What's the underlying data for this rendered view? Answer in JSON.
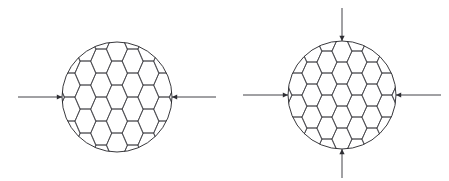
{
  "figure": {
    "background_color": "#ffffff",
    "line_color": "#3c3c41",
    "circle_color": "#232327",
    "arrow_color": "#2e2e33",
    "width": 449,
    "height": 181,
    "panels": [
      {
        "id": "left-panel",
        "name": "undeformed-specimen",
        "label": "",
        "circle": {
          "cx": 117,
          "cy": 97,
          "rx": 55,
          "ry": 55
        },
        "lattice": {
          "type": "hexagonal-honeycomb",
          "orientation": "flat-top",
          "cell_width": 21,
          "cell_height": 24,
          "col_spacing": 15.75,
          "row_spacing": 24
        },
        "loads": [
          {
            "name": "load-arrow-left",
            "direction": "right",
            "from_x": 18,
            "to_x": 62,
            "y": 97,
            "head": "inward"
          },
          {
            "name": "load-arrow-right",
            "direction": "left",
            "from_x": 216,
            "to_x": 172,
            "y": 97,
            "head": "inward"
          }
        ]
      },
      {
        "id": "right-panel",
        "name": "compressed-specimen",
        "label": "",
        "circle": {
          "cx": 342,
          "cy": 95,
          "rx": 54,
          "ry": 54
        },
        "lattice": {
          "type": "hexagonal-honeycomb",
          "orientation": "flat-top",
          "cell_width": 20,
          "cell_height": 22,
          "col_spacing": 15.0,
          "row_spacing": 22
        },
        "loads": [
          {
            "name": "load-arrow-left",
            "direction": "right",
            "from_x": 243,
            "to_x": 288,
            "y": 95,
            "head": "inward"
          },
          {
            "name": "load-arrow-right",
            "direction": "left",
            "from_x": 441,
            "to_x": 396,
            "y": 95,
            "head": "inward"
          },
          {
            "name": "load-arrow-top",
            "direction": "down",
            "from_y": 8,
            "to_y": 41,
            "x": 342,
            "head": "inward"
          },
          {
            "name": "load-arrow-bottom",
            "direction": "up",
            "from_y": 178,
            "to_y": 149,
            "x": 342,
            "head": "inward"
          }
        ]
      }
    ]
  }
}
